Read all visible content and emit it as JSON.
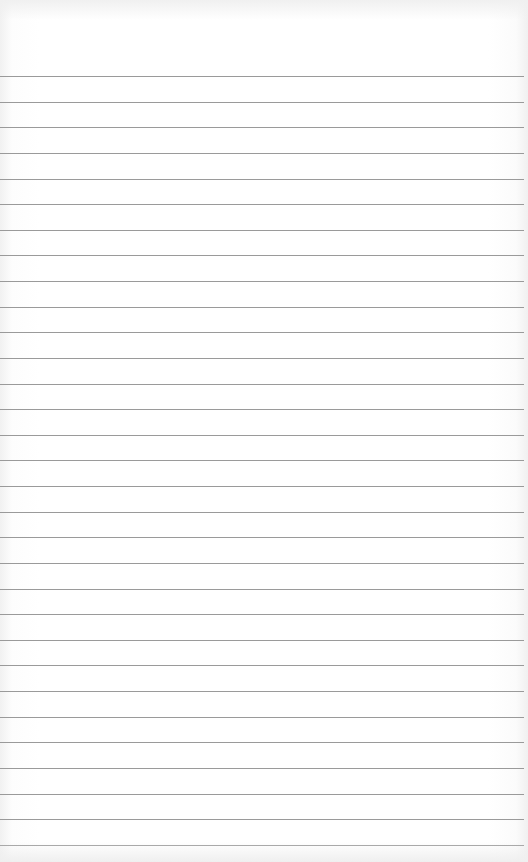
{
  "image": {
    "subject": "blank lined notebook paper",
    "line_color": "#9a9a9a",
    "background_color": "#ffffff",
    "line_count": 31,
    "first_line_y": 76,
    "line_spacing": 25.63
  }
}
